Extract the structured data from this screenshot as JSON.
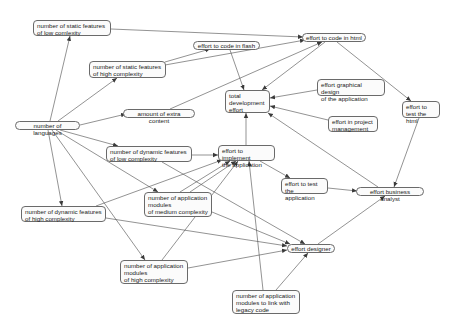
{
  "diagram": {
    "nodes": [
      {
        "id": "static_low",
        "label": "number of static features\nof low comlexity",
        "x": 33,
        "y": 20,
        "w": 78,
        "h": 16
      },
      {
        "id": "code_html",
        "label": "effort to code in html",
        "x": 302,
        "y": 33,
        "w": 64,
        "h": 9,
        "shape": "pill"
      },
      {
        "id": "code_flash",
        "label": "effort to code in flash",
        "x": 193,
        "y": 41,
        "w": 67,
        "h": 9,
        "shape": "pill"
      },
      {
        "id": "static_high",
        "label": "number of static features\nof high complexity",
        "x": 89,
        "y": 61,
        "w": 77,
        "h": 17
      },
      {
        "id": "graphical_design",
        "label": "effort graphical design\nof the application",
        "x": 317,
        "y": 79,
        "w": 68,
        "h": 17
      },
      {
        "id": "total_effort",
        "label": "total\ndevelopment\neffort",
        "x": 225,
        "y": 90,
        "w": 45,
        "h": 23
      },
      {
        "id": "test_html",
        "label": "effort to\ntest the html",
        "x": 402,
        "y": 101,
        "w": 38,
        "h": 17
      },
      {
        "id": "extra_content",
        "label": "amount of extra content",
        "x": 123,
        "y": 109,
        "w": 72,
        "h": 9,
        "shape": "pill"
      },
      {
        "id": "languages",
        "label": "number of languages",
        "x": 15,
        "y": 121,
        "w": 65,
        "h": 9,
        "shape": "pill"
      },
      {
        "id": "project_mgmt",
        "label": "effort in project\nmanagement",
        "x": 328,
        "y": 116,
        "w": 50,
        "h": 16
      },
      {
        "id": "dyn_low",
        "label": "number of dynamic features\nof low complexity",
        "x": 106,
        "y": 146,
        "w": 86,
        "h": 16
      },
      {
        "id": "implement",
        "label": "effort to implement\nthe application",
        "x": 218,
        "y": 145,
        "w": 57,
        "h": 16
      },
      {
        "id": "test_app",
        "label": "effort to test\nthe application",
        "x": 281,
        "y": 178,
        "w": 47,
        "h": 16
      },
      {
        "id": "business_analyst",
        "label": "effort business analyst",
        "x": 356,
        "y": 187,
        "w": 68,
        "h": 9,
        "shape": "pill"
      },
      {
        "id": "app_medium",
        "label": "number of application\nmodules\nof medium complexity",
        "x": 144,
        "y": 192,
        "w": 68,
        "h": 25
      },
      {
        "id": "dyn_high",
        "label": "number of dynamic features\nof high complexity",
        "x": 21,
        "y": 206,
        "w": 85,
        "h": 16
      },
      {
        "id": "designer",
        "label": "effort designer",
        "x": 287,
        "y": 244,
        "w": 48,
        "h": 9,
        "shape": "pill"
      },
      {
        "id": "app_high",
        "label": "number of application\nmodules\nof high complexity",
        "x": 120,
        "y": 260,
        "w": 68,
        "h": 24
      },
      {
        "id": "app_legacy",
        "label": "number of application\nmodules to link with\nlegacy code",
        "x": 232,
        "y": 290,
        "w": 68,
        "h": 24
      }
    ],
    "edges": [
      {
        "from": "languages",
        "to": "static_low",
        "x1": 50,
        "y1": 121,
        "x2": 70,
        "y2": 36
      },
      {
        "from": "languages",
        "to": "static_high",
        "x1": 58,
        "y1": 121,
        "x2": 117,
        "y2": 78
      },
      {
        "from": "languages",
        "to": "extra_content",
        "x1": 80,
        "y1": 125,
        "x2": 126,
        "y2": 114
      },
      {
        "from": "languages",
        "to": "dyn_low",
        "x1": 60,
        "y1": 130,
        "x2": 118,
        "y2": 146
      },
      {
        "from": "languages",
        "to": "dyn_high",
        "x1": 48,
        "y1": 130,
        "x2": 62,
        "y2": 206
      },
      {
        "from": "languages",
        "to": "app_medium",
        "x1": 56,
        "y1": 130,
        "x2": 158,
        "y2": 192
      },
      {
        "from": "languages",
        "to": "app_high",
        "x1": 52,
        "y1": 130,
        "x2": 145,
        "y2": 260
      },
      {
        "from": "static_low",
        "to": "code_html",
        "x1": 111,
        "y1": 29,
        "x2": 303,
        "y2": 37
      },
      {
        "from": "static_high",
        "to": "code_flash",
        "x1": 165,
        "y1": 62,
        "x2": 210,
        "y2": 49
      },
      {
        "from": "static_high",
        "to": "code_html",
        "x1": 165,
        "y1": 65,
        "x2": 305,
        "y2": 40
      },
      {
        "from": "code_flash",
        "to": "total_effort",
        "x1": 230,
        "y1": 50,
        "x2": 244,
        "y2": 90
      },
      {
        "from": "extra_content",
        "to": "code_html",
        "x1": 170,
        "y1": 109,
        "x2": 322,
        "y2": 42
      },
      {
        "from": "code_html",
        "to": "total_effort",
        "x1": 325,
        "y1": 42,
        "x2": 262,
        "y2": 90
      },
      {
        "from": "code_html",
        "to": "test_html",
        "x1": 337,
        "y1": 42,
        "x2": 411,
        "y2": 101
      },
      {
        "from": "graphical_design",
        "to": "total_effort",
        "x1": 317,
        "y1": 90,
        "x2": 270,
        "y2": 98
      },
      {
        "from": "project_mgmt",
        "to": "total_effort",
        "x1": 328,
        "y1": 120,
        "x2": 270,
        "y2": 106
      },
      {
        "from": "implement",
        "to": "total_effort",
        "x1": 246,
        "y1": 145,
        "x2": 246,
        "y2": 113
      },
      {
        "from": "business_analyst",
        "to": "total_effort",
        "x1": 378,
        "y1": 187,
        "x2": 268,
        "y2": 113
      },
      {
        "from": "test_html",
        "to": "business_analyst",
        "x1": 419,
        "y1": 118,
        "x2": 394,
        "y2": 187
      },
      {
        "from": "dyn_low",
        "to": "implement",
        "x1": 192,
        "y1": 155,
        "x2": 218,
        "y2": 155
      },
      {
        "from": "dyn_low",
        "to": "designer",
        "x1": 162,
        "y1": 162,
        "x2": 305,
        "y2": 244
      },
      {
        "from": "implement",
        "to": "test_app",
        "x1": 260,
        "y1": 161,
        "x2": 290,
        "y2": 178
      },
      {
        "from": "test_app",
        "to": "business_analyst",
        "x1": 328,
        "y1": 188,
        "x2": 357,
        "y2": 191
      },
      {
        "from": "dyn_high",
        "to": "implement",
        "x1": 96,
        "y1": 206,
        "x2": 222,
        "y2": 160
      },
      {
        "from": "dyn_high",
        "to": "designer",
        "x1": 106,
        "y1": 218,
        "x2": 287,
        "y2": 246
      },
      {
        "from": "app_medium",
        "to": "implement",
        "x1": 190,
        "y1": 192,
        "x2": 236,
        "y2": 161
      },
      {
        "from": "app_medium",
        "to": "designer",
        "x1": 212,
        "y1": 212,
        "x2": 290,
        "y2": 244
      },
      {
        "from": "app_high",
        "to": "implement",
        "x1": 162,
        "y1": 260,
        "x2": 238,
        "y2": 161
      },
      {
        "from": "app_high",
        "to": "designer",
        "x1": 188,
        "y1": 268,
        "x2": 287,
        "y2": 250
      },
      {
        "from": "app_legacy",
        "to": "implement",
        "x1": 263,
        "y1": 290,
        "x2": 249,
        "y2": 161
      },
      {
        "from": "app_legacy",
        "to": "designer",
        "x1": 276,
        "y1": 290,
        "x2": 308,
        "y2": 253
      },
      {
        "from": "designer",
        "to": "business_analyst",
        "x1": 318,
        "y1": 244,
        "x2": 385,
        "y2": 196
      },
      {
        "from": "app_medium",
        "to": "implement_2",
        "x1": 180,
        "y1": 192,
        "x2": 230,
        "y2": 161
      }
    ],
    "colors": {
      "stroke": "#4a4a4a",
      "node_border": "#6a6a6a",
      "node_fill": "#fbfbfb",
      "text": "#222222",
      "background": "#ffffff"
    }
  }
}
